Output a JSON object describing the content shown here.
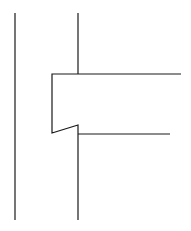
{
  "diagram": {
    "stroke_color": "#1a1a1a",
    "background": "#ffffff",
    "stroke_width": 1.2,
    "lines": [
      {
        "name": "left-vertical-line",
        "points": "15,13 15,220"
      },
      {
        "name": "upper-vertical-line",
        "points": "78,13 78,74"
      },
      {
        "name": "beam-outline",
        "points": "181,74 52,74 52,133 78,125 78,220"
      },
      {
        "name": "beam-bottom-line",
        "points": "78,134 170,134"
      }
    ]
  }
}
